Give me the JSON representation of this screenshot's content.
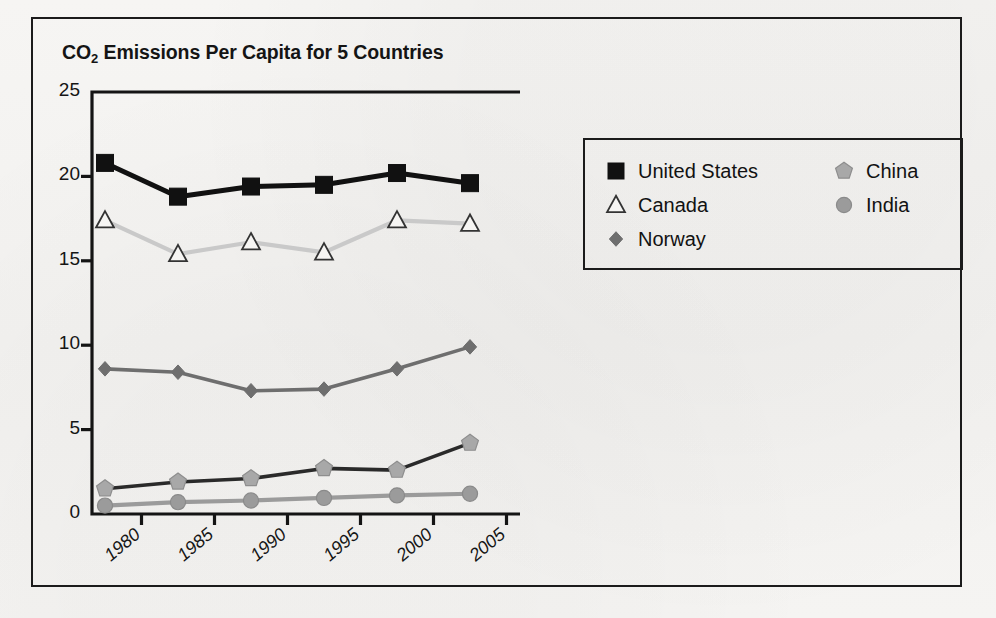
{
  "figure": {
    "title_main": "CO",
    "title_sub": "2",
    "title_rest": " Emissions Per Capita for 5 Countries"
  },
  "chart_data": {
    "type": "line",
    "title": "CO2 Emissions Per Capita for 5 Countries",
    "xlabel": "",
    "ylabel": "Metric Tons",
    "categories": [
      "1980",
      "1985",
      "1990",
      "1995",
      "2000",
      "2005"
    ],
    "x_tick_labels": [
      "1980",
      "1985",
      "1990",
      "1995",
      "2000",
      "2005"
    ],
    "y_tick_labels": [
      "0",
      "5",
      "10",
      "15",
      "20",
      "25"
    ],
    "ylim": [
      0,
      25
    ],
    "y_ticks": [
      0,
      5,
      10,
      15,
      20,
      25
    ],
    "grid": false,
    "legend_position": "right",
    "series": [
      {
        "name": "United States",
        "marker": "filled-square",
        "color": "#111111",
        "marker_fill": "#111111",
        "marker_stroke": "#111111",
        "values": [
          20.8,
          18.8,
          19.4,
          19.5,
          20.2,
          19.6
        ]
      },
      {
        "name": "Canada",
        "marker": "open-triangle",
        "color": "#c9c9c9",
        "marker_fill": "#f6f5f3",
        "marker_stroke": "#333333",
        "values": [
          17.4,
          15.4,
          16.1,
          15.5,
          17.4,
          17.2
        ]
      },
      {
        "name": "Norway",
        "marker": "filled-diamond",
        "color": "#6e6e6e",
        "marker_fill": "#6e6e6e",
        "marker_stroke": "#6e6e6e",
        "values": [
          8.6,
          8.4,
          7.3,
          7.4,
          8.6,
          9.9
        ]
      },
      {
        "name": "China",
        "marker": "filled-pentagon",
        "color": "#2a2a2a",
        "marker_fill": "#a8a8a8",
        "marker_stroke": "#8e8e8e",
        "values": [
          1.5,
          1.9,
          2.1,
          2.7,
          2.6,
          4.2
        ]
      },
      {
        "name": "India",
        "marker": "filled-circle",
        "color": "#9b9b9b",
        "marker_fill": "#9b9b9b",
        "marker_stroke": "#8a8a8a",
        "values": [
          0.5,
          0.7,
          0.8,
          0.95,
          1.1,
          1.2
        ]
      }
    ]
  },
  "legend": {
    "left_column": [
      {
        "label": "United States",
        "marker": "filled-square"
      },
      {
        "label": "Canada",
        "marker": "open-triangle"
      },
      {
        "label": "Norway",
        "marker": "filled-diamond"
      }
    ],
    "right_column": [
      {
        "label": "China",
        "marker": "filled-pentagon"
      },
      {
        "label": "India",
        "marker": "filled-circle"
      }
    ]
  }
}
